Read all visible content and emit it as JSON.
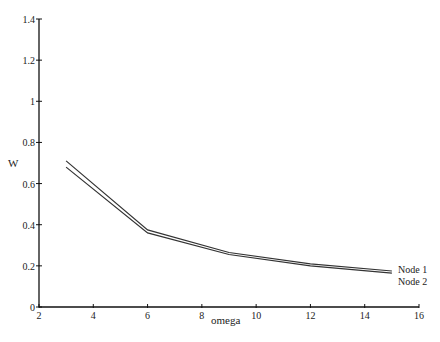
{
  "chart_data": {
    "type": "line",
    "title": "",
    "xlabel": "omega",
    "ylabel": "W",
    "xlim": [
      2,
      16
    ],
    "ylim": [
      0,
      1.4
    ],
    "xticks": [
      2,
      4,
      6,
      8,
      10,
      12,
      14,
      16
    ],
    "yticks": [
      0,
      0.2,
      0.4,
      0.6,
      0.8,
      1,
      1.2,
      1.4
    ],
    "ytick_labels": [
      "0",
      "0.2",
      "0.4",
      "0.6",
      "0.8",
      "1",
      "1.2",
      "1.4"
    ],
    "grid": false,
    "legend_position": "inline-right",
    "x": [
      3,
      6,
      9,
      12,
      15
    ],
    "series": [
      {
        "name": "Node 1",
        "values": [
          0.71,
          0.375,
          0.265,
          0.21,
          0.175
        ],
        "color": "#333333"
      },
      {
        "name": "Node 2",
        "values": [
          0.68,
          0.36,
          0.255,
          0.2,
          0.165
        ],
        "color": "#333333"
      }
    ]
  }
}
